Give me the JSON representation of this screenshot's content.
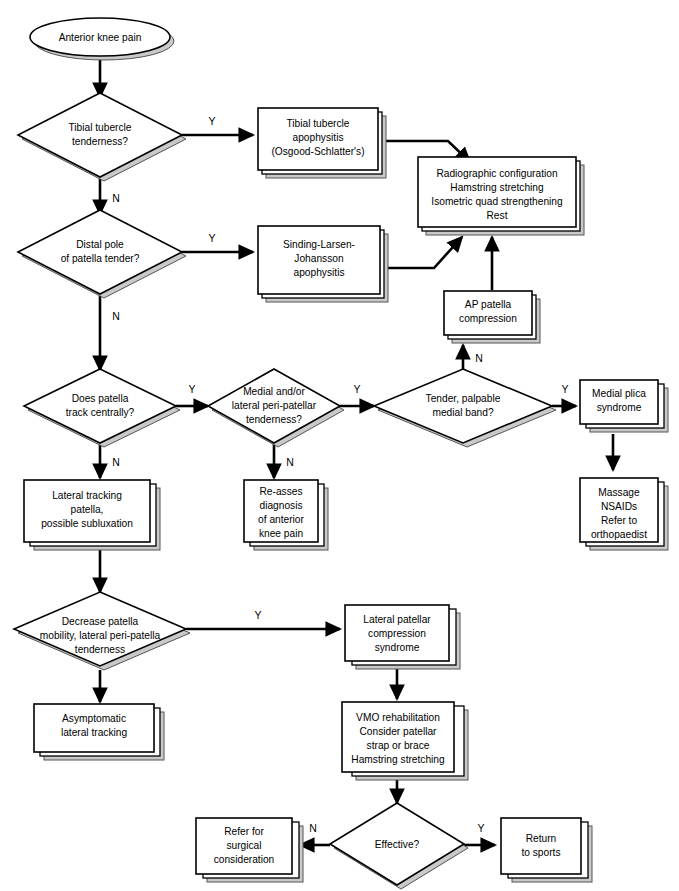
{
  "diagram": {
    "branch_yes": "Y",
    "branch_no": "N",
    "nodes": {
      "start": {
        "type": "terminator",
        "label": "Anterior knee pain"
      },
      "d_tibial_tubercle": {
        "type": "decision",
        "lines": [
          "Tibial tubercle",
          "tenderness?"
        ]
      },
      "b_osgood": {
        "type": "process",
        "lines": [
          "Tibial tubercle",
          "apophysitis",
          "(Osgood-Schlatter's)"
        ]
      },
      "b_radiographic": {
        "type": "process",
        "lines": [
          "Radiographic configuration",
          "Hamstring stretching",
          "Isometric quad strengthening",
          "Rest"
        ]
      },
      "d_distal_pole": {
        "type": "decision",
        "lines": [
          "Distal pole",
          "of patella tender?"
        ]
      },
      "b_sinding": {
        "type": "process",
        "lines": [
          "Sinding-Larsen-",
          "Johansson",
          "apophysitis"
        ]
      },
      "b_ap_patella": {
        "type": "process",
        "lines": [
          "AP patella",
          "compression"
        ]
      },
      "d_track_centrally": {
        "type": "decision",
        "lines": [
          "Does patella",
          "track centrally?"
        ]
      },
      "d_peripatellar": {
        "type": "decision",
        "lines": [
          "Medial and/or",
          "lateral peri-patellar",
          "tenderness?"
        ]
      },
      "d_medial_band": {
        "type": "decision",
        "lines": [
          "Tender, palpable",
          "medial band?"
        ]
      },
      "b_medial_plica": {
        "type": "process",
        "lines": [
          "Medial plica",
          "syndrome"
        ]
      },
      "b_massage": {
        "type": "process",
        "lines": [
          "Massage",
          "NSAIDs",
          "Refer to",
          "orthopaedist"
        ]
      },
      "b_lateral_tracking": {
        "type": "process",
        "lines": [
          "Lateral tracking",
          "patella,",
          "possible subluxation"
        ]
      },
      "b_reasses": {
        "type": "process",
        "lines": [
          "Re-asses",
          "diagnosis",
          "of anterior",
          "knee pain"
        ]
      },
      "d_decrease_mobility": {
        "type": "decision",
        "lines": [
          "Decrease patella",
          "mobility, lateral peri-patella",
          "tenderness"
        ]
      },
      "b_lpcs": {
        "type": "process",
        "lines": [
          "Lateral patellar",
          "compression",
          "syndrome"
        ]
      },
      "b_asymptomatic": {
        "type": "process",
        "lines": [
          "Asymptomatic",
          "lateral tracking"
        ]
      },
      "b_vmo": {
        "type": "process",
        "lines": [
          "VMO rehabilitation",
          "Consider patellar",
          "strap or brace",
          "Hamstring stretching"
        ]
      },
      "d_effective": {
        "type": "decision",
        "lines": [
          "Effective?"
        ]
      },
      "b_refer_surgical": {
        "type": "process",
        "lines": [
          "Refer for",
          "surgical",
          "consideration"
        ]
      },
      "b_return_sports": {
        "type": "process",
        "lines": [
          "Return",
          "to sports"
        ]
      }
    },
    "edges": [
      {
        "from": "start",
        "to": "d_tibial_tubercle",
        "label": ""
      },
      {
        "from": "d_tibial_tubercle",
        "to": "b_osgood",
        "label": "Y"
      },
      {
        "from": "d_tibial_tubercle",
        "to": "d_distal_pole",
        "label": "N"
      },
      {
        "from": "b_osgood",
        "to": "b_radiographic",
        "label": ""
      },
      {
        "from": "d_distal_pole",
        "to": "b_sinding",
        "label": "Y"
      },
      {
        "from": "d_distal_pole",
        "to": "d_track_centrally",
        "label": "N"
      },
      {
        "from": "b_sinding",
        "to": "b_radiographic",
        "label": ""
      },
      {
        "from": "b_ap_patella",
        "to": "b_radiographic",
        "label": ""
      },
      {
        "from": "d_track_centrally",
        "to": "d_peripatellar",
        "label": "Y"
      },
      {
        "from": "d_track_centrally",
        "to": "b_lateral_tracking",
        "label": "N"
      },
      {
        "from": "d_peripatellar",
        "to": "d_medial_band",
        "label": "Y"
      },
      {
        "from": "d_peripatellar",
        "to": "b_reasses",
        "label": "N"
      },
      {
        "from": "d_medial_band",
        "to": "b_medial_plica",
        "label": "Y"
      },
      {
        "from": "d_medial_band",
        "to": "b_ap_patella",
        "label": "N"
      },
      {
        "from": "b_medial_plica",
        "to": "b_massage",
        "label": ""
      },
      {
        "from": "b_lateral_tracking",
        "to": "d_decrease_mobility",
        "label": ""
      },
      {
        "from": "d_decrease_mobility",
        "to": "b_lpcs",
        "label": "Y"
      },
      {
        "from": "d_decrease_mobility",
        "to": "b_asymptomatic",
        "label": ""
      },
      {
        "from": "b_lpcs",
        "to": "b_vmo",
        "label": ""
      },
      {
        "from": "b_vmo",
        "to": "d_effective",
        "label": ""
      },
      {
        "from": "d_effective",
        "to": "b_refer_surgical",
        "label": "N"
      },
      {
        "from": "d_effective",
        "to": "b_return_sports",
        "label": "Y"
      }
    ],
    "colors": {
      "shape_fill": "#ffffff",
      "shape_stroke": "#000000",
      "shadow_fill": "#c9c9c9",
      "background": "#ffffff"
    }
  }
}
